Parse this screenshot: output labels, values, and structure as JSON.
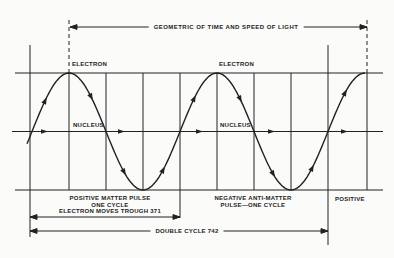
{
  "header": {
    "dimension_label": "GEOMETRIC OF TIME AND SPEED OF LIGHT"
  },
  "wave": {
    "electron_label_1": "ELECTRON",
    "electron_label_2": "ELECTRON",
    "nucleus_label_1": "NUCLEUS",
    "nucleus_label_2": "NUCLEUS"
  },
  "annotations": {
    "positive_pulse": {
      "line1": "POSITIVE MATTER PULSE",
      "line2": "ONE CYCLE",
      "line3": "ELECTRON MOVES TROUGH 371"
    },
    "negative_pulse": {
      "line1": "NEGATIVE ANTI-MATTER",
      "line2": "PULSE—ONE CYCLE"
    },
    "positive_right": "POSITIVE",
    "double_cycle": "DOUBLE CYCLE 742"
  },
  "colors": {
    "ink": "#222222",
    "paper": "#fbfbfa"
  }
}
